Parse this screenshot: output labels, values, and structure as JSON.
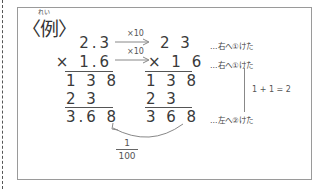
{
  "example": {
    "title": "〈例〉",
    "ruby": "れい"
  },
  "left_calc": {
    "multiplicand": "2.3",
    "multiplier": "× 1.6",
    "partial1": "1 3 8",
    "partial2": "2 3",
    "result": "3.6 8"
  },
  "arrows": {
    "top_label": "×10",
    "bottom_label": "×10"
  },
  "right_calc": {
    "multiplicand": "2 3",
    "multiplier": "× 1 6",
    "partial1": "1 3 8",
    "partial2": "2 3",
    "result": "3 6 8"
  },
  "annotations": {
    "line1": "…右へ①けた",
    "line2": "…右へ①けた",
    "sum": "1 + 1 = 2",
    "line3": "…左へ②けた"
  },
  "fraction": {
    "numerator": "1",
    "denominator": "100"
  },
  "colors": {
    "text": "#333333",
    "border": "#9a9a9a",
    "line": "#777777"
  }
}
